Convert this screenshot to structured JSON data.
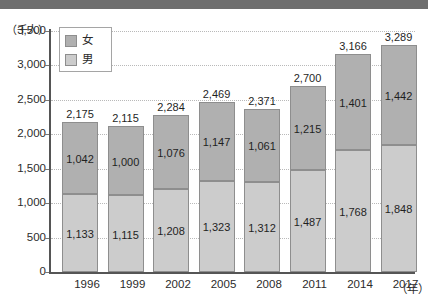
{
  "banner": {
    "color": "#6e6e6e"
  },
  "chart_data": {
    "type": "bar",
    "subtype": "stacked-vertical",
    "title": "",
    "xlabel": "（年）",
    "ylabel": "（千人）",
    "ylim": [
      0,
      3500
    ],
    "ytick_step": 500,
    "grid": true,
    "legend_position": "top-left",
    "categories": [
      "1996",
      "1999",
      "2002",
      "2005",
      "2008",
      "2011",
      "2014",
      "2017"
    ],
    "series": [
      {
        "name": "男",
        "stack_position": "bottom",
        "color": "#cccccc",
        "values": [
          1133,
          1115,
          1208,
          1323,
          1312,
          1487,
          1768,
          1848
        ],
        "labels": [
          "1,133",
          "1,115",
          "1,208",
          "1,323",
          "1,312",
          "1,487",
          "1,768",
          "1,848"
        ]
      },
      {
        "name": "女",
        "stack_position": "top",
        "color": "#b0b0b0",
        "values": [
          1042,
          1000,
          1076,
          1147,
          1061,
          1215,
          1401,
          1442
        ],
        "labels": [
          "1,042",
          "1,000",
          "1,076",
          "1,147",
          "1,061",
          "1,215",
          "1,401",
          "1,442"
        ]
      }
    ],
    "totals": [
      2175,
      2115,
      2284,
      2469,
      2371,
      2700,
      3166,
      3289
    ],
    "total_labels": [
      "2,175",
      "2,115",
      "2,284",
      "2,469",
      "2,371",
      "2,700",
      "3,166",
      "3,289"
    ],
    "ytick_labels": [
      "3,500",
      "3,000",
      "2,500",
      "2,000",
      "1,500",
      "1,000",
      "500",
      "0"
    ],
    "ytick_values": [
      3500,
      3000,
      2500,
      2000,
      1500,
      1000,
      500,
      0
    ]
  },
  "legend": {
    "items": [
      {
        "label": "女",
        "color": "#b0b0b0"
      },
      {
        "label": "男",
        "color": "#cccccc"
      }
    ]
  }
}
